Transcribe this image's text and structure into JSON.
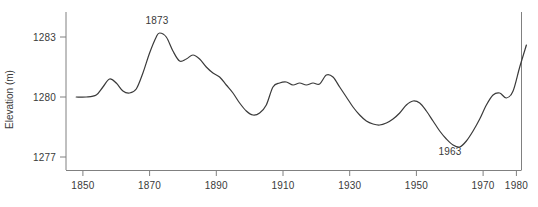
{
  "chart_data": {
    "type": "line",
    "title": "",
    "xlabel": "",
    "ylabel": "Elevation (m)",
    "xlim": [
      1843,
      1984
    ],
    "ylim": [
      1276.3,
      1284.1
    ],
    "grid": false,
    "legend": null,
    "line_color": "#3a3a3a",
    "axis_color": "#808080",
    "xticks": [
      1850,
      1870,
      1890,
      1910,
      1930,
      1950,
      1970,
      1980
    ],
    "xtick_labels": [
      "1850",
      "1870",
      "1890",
      "1910",
      "1930",
      "1950",
      "1970",
      "1980"
    ],
    "yticks": [
      1277,
      1280,
      1283
    ],
    "ytick_labels": [
      "1277",
      "1280",
      "1283"
    ],
    "annotations": [
      {
        "text": "1873",
        "x": 1873,
        "y": 1283.2
      },
      {
        "text": "1963",
        "x": 1963,
        "y": 1277.5
      }
    ],
    "series": [
      {
        "name": "Lake level",
        "x": [
          1848,
          1851,
          1854,
          1856,
          1858,
          1860,
          1862,
          1864,
          1866,
          1868,
          1870,
          1872,
          1873,
          1875,
          1877,
          1879,
          1881,
          1883,
          1885,
          1887,
          1889,
          1891,
          1893,
          1895,
          1897,
          1899,
          1901,
          1903,
          1905,
          1907,
          1909,
          1911,
          1913,
          1915,
          1917,
          1919,
          1921,
          1923,
          1925,
          1927,
          1929,
          1931,
          1933,
          1935,
          1937,
          1939,
          1941,
          1943,
          1945,
          1947,
          1949,
          1951,
          1953,
          1955,
          1957,
          1959,
          1961,
          1963,
          1965,
          1967,
          1969,
          1971,
          1973,
          1975,
          1977,
          1979,
          1981,
          1983
        ],
        "values": [
          1280.0,
          1280.0,
          1280.1,
          1280.5,
          1280.9,
          1280.7,
          1280.3,
          1280.2,
          1280.4,
          1281.2,
          1282.2,
          1283.0,
          1283.2,
          1283.0,
          1282.3,
          1281.8,
          1281.9,
          1282.1,
          1281.9,
          1281.5,
          1281.2,
          1281.0,
          1280.6,
          1280.2,
          1279.7,
          1279.3,
          1279.1,
          1279.2,
          1279.6,
          1280.5,
          1280.7,
          1280.75,
          1280.6,
          1280.7,
          1280.6,
          1280.7,
          1280.65,
          1281.1,
          1281.0,
          1280.5,
          1280.0,
          1279.5,
          1279.1,
          1278.8,
          1278.65,
          1278.6,
          1278.7,
          1278.9,
          1279.2,
          1279.6,
          1279.8,
          1279.7,
          1279.3,
          1278.8,
          1278.3,
          1277.9,
          1277.6,
          1277.5,
          1277.8,
          1278.3,
          1278.9,
          1279.6,
          1280.1,
          1280.2,
          1279.95,
          1280.3,
          1281.5,
          1282.6
        ]
      }
    ]
  }
}
